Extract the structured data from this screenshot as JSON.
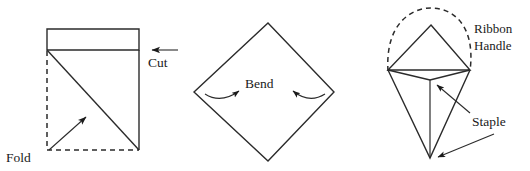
{
  "figure": {
    "background_color": "#ffffff",
    "line_color": "#2b2b2b",
    "text_color": "#1a1a1a",
    "panels": [
      {
        "id": "panel-cut-fold",
        "labels": [
          {
            "name": "cut",
            "text": "Cut"
          },
          {
            "name": "fold",
            "text": "Fold"
          }
        ]
      },
      {
        "id": "panel-bend",
        "labels": [
          {
            "name": "bend",
            "text": "Bend"
          }
        ]
      },
      {
        "id": "panel-ribbon-staple",
        "labels": [
          {
            "name": "ribbon",
            "text": "Ribbon"
          },
          {
            "name": "handle",
            "text": "Handle"
          },
          {
            "name": "staple",
            "text": "Staple"
          }
        ]
      }
    ]
  },
  "labels": {
    "cut": "Cut",
    "fold": "Fold",
    "bend": "Bend",
    "ribbon": "Ribbon",
    "handle": "Handle",
    "staple": "Staple"
  }
}
